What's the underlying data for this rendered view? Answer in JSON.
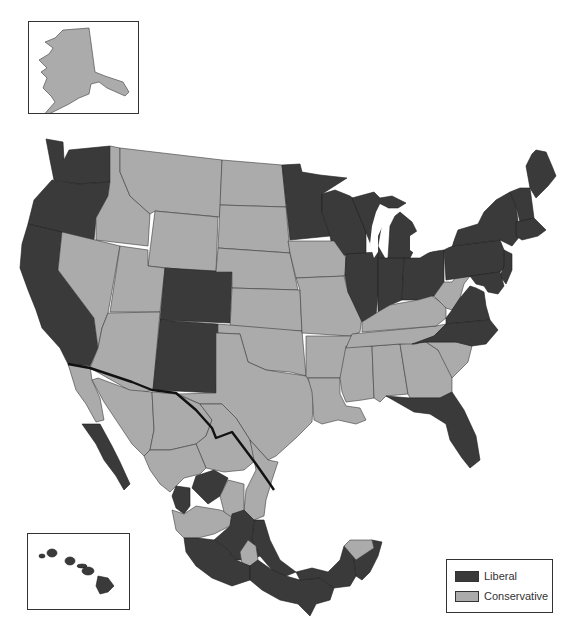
{
  "map": {
    "title": "",
    "region": "United States and Mexico",
    "colors": {
      "liberal": "#3a3a3a",
      "conservative": "#ababab",
      "international_border": "#111111",
      "background": "#ffffff"
    },
    "insets": [
      {
        "name": "Alaska",
        "category": "Conservative"
      },
      {
        "name": "Hawaii",
        "category": "Liberal"
      }
    ]
  },
  "legend": {
    "items": [
      {
        "label": "Liberal",
        "color": "#3a3a3a"
      },
      {
        "label": "Conservative",
        "color": "#ababab"
      }
    ]
  },
  "regions": {
    "liberal": [
      "Washington",
      "Oregon",
      "California",
      "Colorado",
      "New Mexico",
      "Minnesota",
      "Wisconsin",
      "Michigan",
      "Illinois",
      "Indiana",
      "Ohio",
      "Pennsylvania",
      "New York",
      "Vermont",
      "New Hampshire",
      "Maine",
      "Massachusetts",
      "Rhode Island",
      "Connecticut",
      "New Jersey",
      "Delaware",
      "Maryland",
      "Virginia",
      "North Carolina",
      "Florida",
      "Hawaii",
      "Baja California Sur",
      "Nayarit",
      "Zacatecas",
      "Aguascalientes",
      "Mexico City region",
      "Guerrero",
      "Oaxaca",
      "Chiapas",
      "Tabasco",
      "Campeche",
      "Quintana Roo",
      "Veracruz",
      "Michoacán",
      "Estado de México",
      "Morelos",
      "Hidalgo"
    ],
    "conservative": [
      "Alaska",
      "Idaho",
      "Montana",
      "Wyoming",
      "Nevada",
      "Utah",
      "Arizona",
      "North Dakota",
      "South Dakota",
      "Nebraska",
      "Kansas",
      "Oklahoma",
      "Texas",
      "Iowa",
      "Missouri",
      "Arkansas",
      "Louisiana",
      "Mississippi",
      "Alabama",
      "Georgia",
      "South Carolina",
      "Tennessee",
      "Kentucky",
      "West Virginia",
      "Baja California",
      "Sonora",
      "Chihuahua",
      "Coahuila",
      "Nuevo León",
      "Tamaulipas",
      "Sinaloa",
      "Durango",
      "San Luis Potosí",
      "Jalisco",
      "Guanajuato",
      "Querétaro",
      "Colima",
      "Puebla",
      "Yucatán"
    ]
  }
}
